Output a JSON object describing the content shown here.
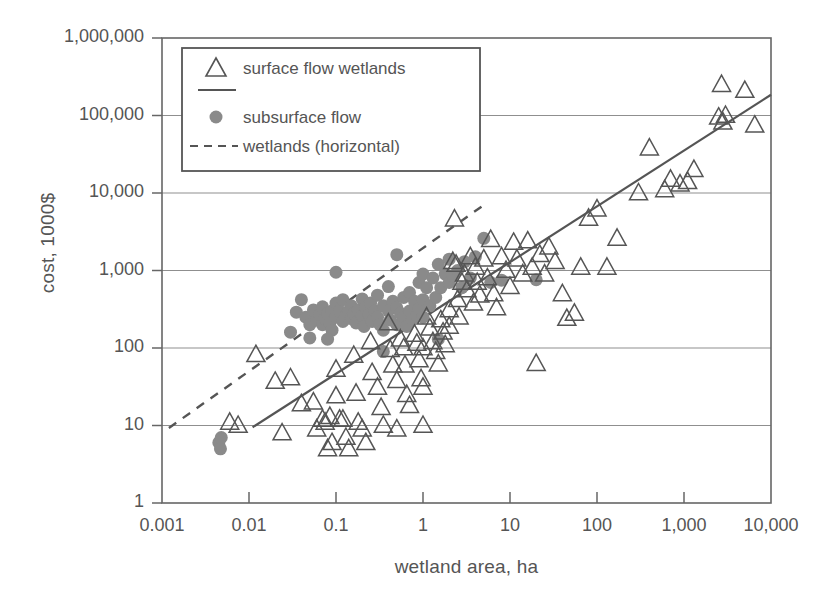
{
  "chart_data": {
    "type": "scatter",
    "title": "",
    "xlabel": "wetland area, ha",
    "ylabel": "cost, 1000$",
    "xscale": "log",
    "yscale": "log",
    "xlim": [
      0.001,
      10000
    ],
    "ylim": [
      1,
      1000000
    ],
    "xticks": [
      "0.001",
      "0.01",
      "0.1",
      "1",
      "10",
      "100",
      "1,000",
      "10,000"
    ],
    "xtick_values": [
      0.001,
      0.01,
      0.1,
      1,
      10,
      100,
      1000,
      10000
    ],
    "yticks": [
      "1",
      "10",
      "100",
      "1,000",
      "10,000",
      "100,000",
      "1,000,000"
    ],
    "ytick_values": [
      1,
      10,
      100,
      1000,
      10000,
      100000,
      1000000
    ],
    "grid": "horizontal",
    "legend_position": "top-left-inside",
    "legend": [
      {
        "label": "surface flow wetlands",
        "marker": "triangle-open",
        "line": "solid"
      },
      {
        "label": "subsurface flow",
        "marker": "circle-filled",
        "line": "none"
      },
      {
        "label": "wetlands (horizontal)",
        "marker": "none",
        "line": "dashed"
      }
    ],
    "series": [
      {
        "name": "surface flow wetlands",
        "marker": "triangle-open",
        "color": "#555555",
        "points": [
          [
            0.006,
            11
          ],
          [
            0.0075,
            10
          ],
          [
            0.012,
            82
          ],
          [
            0.02,
            37
          ],
          [
            0.024,
            8
          ],
          [
            0.03,
            41
          ],
          [
            0.04,
            19
          ],
          [
            0.055,
            20
          ],
          [
            0.06,
            9
          ],
          [
            0.07,
            12
          ],
          [
            0.075,
            11
          ],
          [
            0.08,
            5
          ],
          [
            0.085,
            13
          ],
          [
            0.09,
            6
          ],
          [
            0.1,
            53
          ],
          [
            0.1,
            24
          ],
          [
            0.11,
            12
          ],
          [
            0.12,
            12
          ],
          [
            0.13,
            7
          ],
          [
            0.14,
            5
          ],
          [
            0.16,
            80
          ],
          [
            0.17,
            26
          ],
          [
            0.18,
            11
          ],
          [
            0.2,
            9
          ],
          [
            0.22,
            6
          ],
          [
            0.25,
            120
          ],
          [
            0.26,
            48
          ],
          [
            0.3,
            31
          ],
          [
            0.33,
            17
          ],
          [
            0.35,
            10
          ],
          [
            0.4,
            210
          ],
          [
            0.42,
            95
          ],
          [
            0.45,
            60
          ],
          [
            0.5,
            38
          ],
          [
            0.5,
            9
          ],
          [
            0.55,
            130
          ],
          [
            0.6,
            100
          ],
          [
            0.62,
            60
          ],
          [
            0.65,
            25
          ],
          [
            0.7,
            18
          ],
          [
            0.8,
            150
          ],
          [
            0.85,
            115
          ],
          [
            0.9,
            70
          ],
          [
            0.95,
            40
          ],
          [
            1.0,
            31
          ],
          [
            1.0,
            100
          ],
          [
            1.0,
            10
          ],
          [
            1.1,
            250
          ],
          [
            1.2,
            180
          ],
          [
            1.3,
            120
          ],
          [
            1.4,
            90
          ],
          [
            1.5,
            62
          ],
          [
            1.6,
            230
          ],
          [
            1.7,
            160
          ],
          [
            1.8,
            110
          ],
          [
            2.0,
            310
          ],
          [
            2.0,
            190
          ],
          [
            2.2,
            1300
          ],
          [
            2.3,
            4600
          ],
          [
            2.4,
            1200
          ],
          [
            2.5,
            420
          ],
          [
            2.6,
            250
          ],
          [
            2.8,
            700
          ],
          [
            3.0,
            900
          ],
          [
            3.2,
            560
          ],
          [
            3.5,
            1500
          ],
          [
            3.8,
            380
          ],
          [
            4.0,
            1100
          ],
          [
            4.2,
            700
          ],
          [
            4.5,
            480
          ],
          [
            5.0,
            1400
          ],
          [
            5.5,
            800
          ],
          [
            6.0,
            2500
          ],
          [
            6.5,
            500
          ],
          [
            7.0,
            330
          ],
          [
            8.0,
            1500
          ],
          [
            9.0,
            1000
          ],
          [
            10,
            620
          ],
          [
            11,
            2300
          ],
          [
            12,
            1400
          ],
          [
            14,
            900
          ],
          [
            16,
            2400
          ],
          [
            18,
            1100
          ],
          [
            20,
            63
          ],
          [
            22,
            1600
          ],
          [
            25,
            900
          ],
          [
            28,
            2000
          ],
          [
            33,
            1300
          ],
          [
            40,
            500
          ],
          [
            45,
            240
          ],
          [
            55,
            280
          ],
          [
            65,
            1100
          ],
          [
            80,
            4700
          ],
          [
            100,
            6200
          ],
          [
            130,
            1100
          ],
          [
            170,
            2600
          ],
          [
            300,
            10000
          ],
          [
            400,
            38000
          ],
          [
            600,
            11000
          ],
          [
            700,
            15000
          ],
          [
            900,
            13000
          ],
          [
            1100,
            14000
          ],
          [
            1300,
            20000
          ],
          [
            2500,
            95000
          ],
          [
            2700,
            250000
          ],
          [
            2800,
            82000
          ],
          [
            3000,
            100000
          ],
          [
            5000,
            210000
          ],
          [
            6500,
            75000
          ]
        ]
      },
      {
        "name": "subsurface flow wetlands (horizontal)",
        "marker": "circle-filled",
        "color": "#8a8a8a",
        "points": [
          [
            0.0045,
            6
          ],
          [
            0.0047,
            5
          ],
          [
            0.0048,
            7
          ],
          [
            0.03,
            160
          ],
          [
            0.035,
            290
          ],
          [
            0.04,
            420
          ],
          [
            0.045,
            250
          ],
          [
            0.05,
            200
          ],
          [
            0.05,
            135
          ],
          [
            0.055,
            310
          ],
          [
            0.06,
            230
          ],
          [
            0.065,
            270
          ],
          [
            0.07,
            200
          ],
          [
            0.07,
            340
          ],
          [
            0.075,
            240
          ],
          [
            0.08,
            280
          ],
          [
            0.085,
            210
          ],
          [
            0.09,
            170
          ],
          [
            0.09,
            300
          ],
          [
            0.1,
            950
          ],
          [
            0.1,
            380
          ],
          [
            0.1,
            250
          ],
          [
            0.11,
            300
          ],
          [
            0.12,
            220
          ],
          [
            0.12,
            420
          ],
          [
            0.13,
            260
          ],
          [
            0.14,
            300
          ],
          [
            0.15,
            350
          ],
          [
            0.15,
            240
          ],
          [
            0.16,
            280
          ],
          [
            0.17,
            210
          ],
          [
            0.18,
            310
          ],
          [
            0.2,
            430
          ],
          [
            0.2,
            260
          ],
          [
            0.21,
            190
          ],
          [
            0.22,
            330
          ],
          [
            0.24,
            270
          ],
          [
            0.25,
            380
          ],
          [
            0.26,
            220
          ],
          [
            0.28,
            300
          ],
          [
            0.3,
            480
          ],
          [
            0.3,
            250
          ],
          [
            0.32,
            200
          ],
          [
            0.35,
            350
          ],
          [
            0.35,
            170
          ],
          [
            0.4,
            620
          ],
          [
            0.4,
            300
          ],
          [
            0.42,
            230
          ],
          [
            0.45,
            400
          ],
          [
            0.5,
            1600
          ],
          [
            0.5,
            330
          ],
          [
            0.5,
            200
          ],
          [
            0.55,
            280
          ],
          [
            0.6,
            450
          ],
          [
            0.6,
            250
          ],
          [
            0.65,
            190
          ],
          [
            0.7,
            520
          ],
          [
            0.7,
            300
          ],
          [
            0.75,
            230
          ],
          [
            0.8,
            400
          ],
          [
            0.85,
            260
          ],
          [
            0.9,
            700
          ],
          [
            0.9,
            320
          ],
          [
            1.0,
            900
          ],
          [
            1.0,
            420
          ],
          [
            1.0,
            250
          ],
          [
            1.1,
            600
          ],
          [
            1.2,
            350
          ],
          [
            1.3,
            800
          ],
          [
            1.4,
            450
          ],
          [
            1.5,
            1200
          ],
          [
            1.6,
            600
          ],
          [
            1.8,
            900
          ],
          [
            2.0,
            1400
          ],
          [
            2.0,
            700
          ],
          [
            2.2,
            850
          ],
          [
            2.5,
            1000
          ],
          [
            2.8,
            600
          ],
          [
            3.0,
            1300
          ],
          [
            3.5,
            800
          ],
          [
            4.0,
            1500
          ],
          [
            5.0,
            2600
          ],
          [
            6.0,
            700
          ],
          [
            1.5,
            130
          ],
          [
            0.35,
            90
          ],
          [
            0.08,
            130
          ],
          [
            8.0,
            750
          ],
          [
            20,
            760
          ]
        ]
      }
    ],
    "trendlines": [
      {
        "name": "surface flow fit",
        "style": "solid",
        "x": [
          0.011,
          10000
        ],
        "y": [
          9.5,
          185000
        ]
      },
      {
        "name": "subsurface flow fit",
        "style": "dashed",
        "x": [
          0.0012,
          5.0
        ],
        "y": [
          9.3,
          7000
        ]
      }
    ]
  }
}
